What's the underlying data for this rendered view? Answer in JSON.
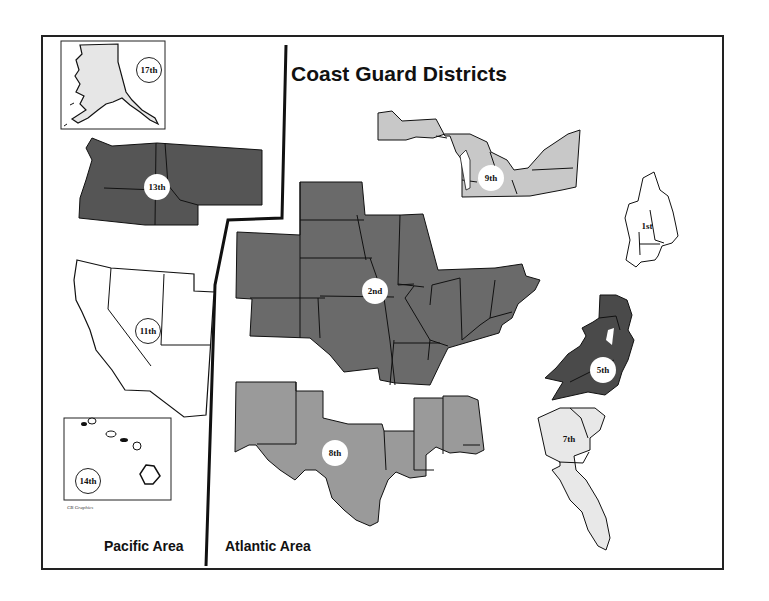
{
  "title": "Coast Guard Districts",
  "areas": {
    "pacific": "Pacific Area",
    "atlantic": "Atlantic Area"
  },
  "credit": "CB Graphics",
  "districts": [
    {
      "id": "17th",
      "label": "17th",
      "region": "Alaska",
      "area": "Pacific",
      "fill": "#e6e6e6"
    },
    {
      "id": "13th",
      "label": "13th",
      "region": "Washington, Oregon, Idaho, Montana",
      "area": "Pacific",
      "fill": "#555555"
    },
    {
      "id": "11th",
      "label": "11th",
      "region": "California, Nevada, Utah, Arizona",
      "area": "Pacific",
      "fill": "#ffffff"
    },
    {
      "id": "14th",
      "label": "14th",
      "region": "Hawaii",
      "area": "Pacific",
      "fill": "#ffffff"
    },
    {
      "id": "9th",
      "label": "9th",
      "region": "Great Lakes",
      "area": "Atlantic",
      "fill": "#c8c8c8"
    },
    {
      "id": "1st",
      "label": "1st",
      "region": "New England / New York",
      "area": "Atlantic",
      "fill": "#ffffff"
    },
    {
      "id": "2nd",
      "label": "2nd",
      "region": "Inland Rivers / Midwest",
      "area": "Atlantic",
      "fill": "#6a6a6a"
    },
    {
      "id": "5th",
      "label": "5th",
      "region": "Mid-Atlantic",
      "area": "Atlantic",
      "fill": "#4a4a4a"
    },
    {
      "id": "8th",
      "label": "8th",
      "region": "Gulf Coast",
      "area": "Atlantic",
      "fill": "#9a9a9a"
    },
    {
      "id": "7th",
      "label": "7th",
      "region": "Southeast",
      "area": "Atlantic",
      "fill": "#e8e8e8"
    }
  ]
}
